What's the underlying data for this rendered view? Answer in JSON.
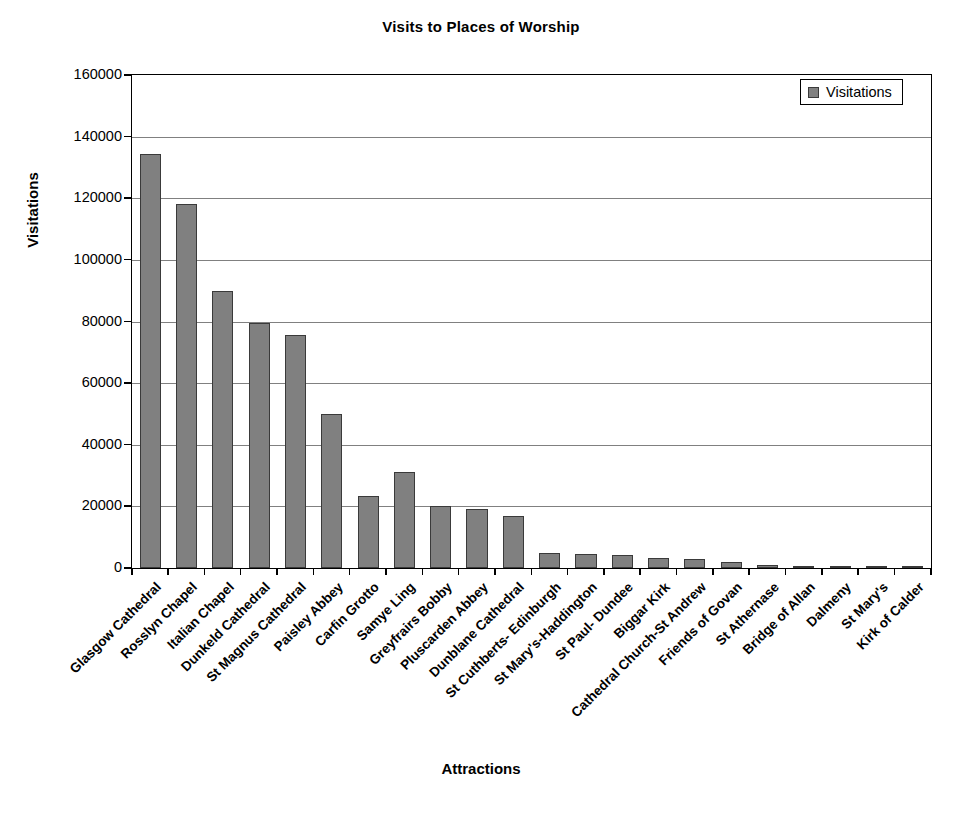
{
  "chart_data": {
    "type": "bar",
    "title": "Visits to Places of Worship",
    "xlabel": "Attractions",
    "ylabel": "Visitations",
    "ylim": [
      0,
      160000
    ],
    "ytick_step": 20000,
    "yticks": [
      0,
      20000,
      40000,
      60000,
      80000,
      100000,
      120000,
      140000,
      160000
    ],
    "ytick_labels": [
      "0",
      "20000",
      "40000",
      "60000",
      "80000",
      "100000",
      "120000",
      "140000",
      "160000"
    ],
    "grid": true,
    "legend": {
      "position": "top-right",
      "entries": [
        "Visitations"
      ]
    },
    "series_name": "Visitations",
    "bar_color": "#808080",
    "bar_edge_color": "#3a3a3a",
    "categories": [
      "Glasgow Cathedral",
      "Rosslyn Chapel",
      "Italian Chapel",
      "Dunkeld Cathedral",
      "St Magnus Cathedral",
      "Paisley Abbey",
      "Carfin Grotto",
      "Samye Ling",
      "Greyfrairs Bobby",
      "Pluscarden Abbey",
      "Dunblane Cathedral",
      "St Cuthberts- Edinburgh",
      "St Mary's-Haddington",
      "St Paul- Dundee",
      "Biggar Kirk",
      "Cathedral Church-St Andrew",
      "Friends of Govan",
      "St Athernase",
      "Bridge of Allan",
      "Dalmeny",
      "St Mary's",
      "Kirk of Calder"
    ],
    "values": [
      134500,
      118000,
      90000,
      79500,
      75500,
      50000,
      23500,
      31000,
      20000,
      19000,
      17000,
      5000,
      4500,
      4300,
      3400,
      2800,
      2100,
      900,
      600,
      600,
      200,
      100
    ]
  }
}
